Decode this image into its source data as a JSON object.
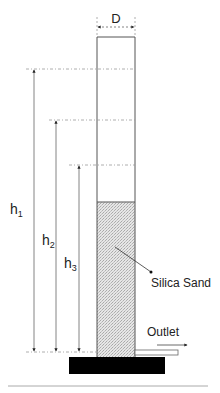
{
  "diagram": {
    "labels": {
      "diameter": "D",
      "h1": "h",
      "h1_sub": "1",
      "h2": "h",
      "h2_sub": "2",
      "h3": "h",
      "h3_sub": "3",
      "material": "Silica Sand",
      "outlet": "Outlet"
    },
    "colors": {
      "line": "#555555",
      "dashed": "#888888",
      "base": "#000000",
      "sand": "#d8d8d8"
    }
  }
}
